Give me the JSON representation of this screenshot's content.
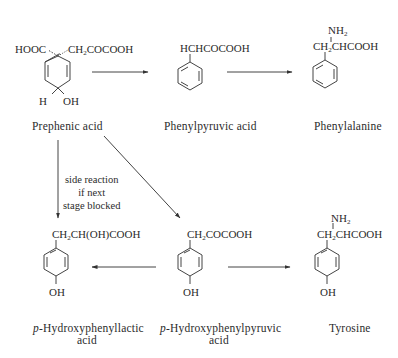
{
  "diagram": {
    "compounds": [
      {
        "id": "prephenic",
        "name": "Prephenic acid",
        "substituents": [
          "HOOC",
          "CH2COCOOH",
          "H",
          "OH"
        ]
      },
      {
        "id": "phenylpyruvic",
        "name": "Phenylpyruvic acid",
        "substituents": [
          "HCHCOCOOH"
        ]
      },
      {
        "id": "phenylalanine",
        "name": "Phenylalanine",
        "substituents": [
          "NH2",
          "CH2CHCOOH"
        ]
      },
      {
        "id": "hpla",
        "name_prefix": "p",
        "name_main": "-Hydroxyphenyllactic",
        "name_line2": "acid",
        "substituents": [
          "CH2CH(OH)COOH",
          "OH"
        ]
      },
      {
        "id": "hppa",
        "name_prefix": "p",
        "name_main": "-Hydroxyphenylpyruvic",
        "name_line2": "acid",
        "substituents": [
          "CH2COCOOH",
          "OH"
        ]
      },
      {
        "id": "tyrosine",
        "name": "Tyrosine",
        "substituents": [
          "NH2",
          "CH2CHCOOH",
          "OH"
        ]
      }
    ],
    "side_reaction_note": [
      "side reaction",
      "if next",
      "stage blocked"
    ],
    "arrows": [
      {
        "from": "prephenic",
        "to": "phenylpyruvic"
      },
      {
        "from": "phenylpyruvic",
        "to": "phenylalanine"
      },
      {
        "from": "prephenic",
        "to": "hpla",
        "note": "side reaction if next stage blocked"
      },
      {
        "from": "prephenic",
        "to": "hppa"
      },
      {
        "from": "hppa",
        "to": "hpla"
      },
      {
        "from": "hppa",
        "to": "tyrosine"
      }
    ],
    "text": {
      "hooc": "HOOC",
      "ch2": "CH",
      "sub2": "2",
      "cocooh": "COCOOH",
      "h": "H",
      "oh": "OH",
      "hchcocooh": "HCHCOCOOH",
      "nh": "NH",
      "chcooh": "CHCOOH",
      "ch_oh_cooh": "CH(OH)COOH"
    }
  }
}
